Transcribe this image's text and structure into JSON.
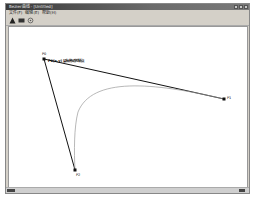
{
  "window": {
    "title": "Bezier曲线 - [Untitled]",
    "controls": [
      "minimize",
      "maximize",
      "close"
    ]
  },
  "menu": {
    "items": [
      "文件(F)",
      "编辑(E)",
      "帮助(H)"
    ]
  },
  "toolbar": {
    "tools": [
      {
        "name": "draw-tool-icon"
      },
      {
        "name": "rect-tool-icon"
      },
      {
        "name": "settings-tool-icon"
      }
    ]
  },
  "canvas": {
    "annotation": "P0(x,y) 鼠标拖动控制点",
    "points": {
      "p0": {
        "label": "P0",
        "x": 42,
        "y": 57
      },
      "p1": {
        "label": "P1",
        "x": 222,
        "y": 97
      },
      "p2": {
        "label": "P2",
        "x": 73,
        "y": 168
      }
    },
    "colors": {
      "control_lines": "#111111",
      "curve": "#999999"
    }
  },
  "statusbar": {
    "left": "就绪",
    "right": "数字"
  }
}
